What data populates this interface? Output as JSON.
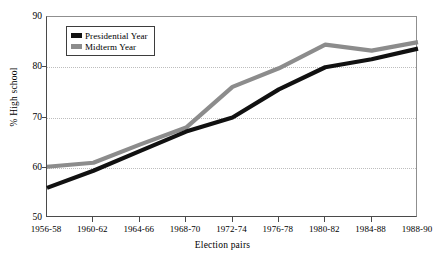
{
  "chart_data": {
    "type": "line",
    "title": "",
    "xlabel": "Election pairs",
    "ylabel": "% High school",
    "categories": [
      "1956-58",
      "1960-62",
      "1964-66",
      "1968-70",
      "1972-74",
      "1976-78",
      "1980-82",
      "1984-88",
      "1988-90"
    ],
    "ylim": [
      50,
      90
    ],
    "yticks": [
      50,
      60,
      70,
      80,
      90
    ],
    "gridlines": [
      60,
      70,
      80
    ],
    "grid": true,
    "legend_position": "upper-left-inside",
    "series": [
      {
        "name": "Presidential Year",
        "color": "#111111",
        "values": [
          56.0,
          59.4,
          63.3,
          67.2,
          70.0,
          75.6,
          80.0,
          81.6,
          83.7
        ]
      },
      {
        "name": "Midterm Year",
        "color": "#8c8c8c",
        "values": [
          60.2,
          61.0,
          64.6,
          68.0,
          76.1,
          79.8,
          84.5,
          83.3,
          85.0
        ]
      }
    ]
  },
  "legend": {
    "entries": [
      {
        "label": "Presidential Year",
        "swatch_color": "#111111"
      },
      {
        "label": "Midterm Year",
        "swatch_color": "#8c8c8c"
      }
    ]
  },
  "axes": {
    "y_title": "% High school",
    "x_title": "Election pairs",
    "y_tick_labels": [
      "90",
      "80",
      "70",
      "60",
      "50"
    ],
    "x_tick_labels": [
      "1956-58",
      "1960-62",
      "1964-66",
      "1968-70",
      "1972-74",
      "1976-78",
      "1980-82",
      "1984-88",
      "1988-90"
    ]
  },
  "colors": {
    "presidential": "#111111",
    "midterm": "#8c8c8c",
    "grid": "#bdbdbd",
    "axis": "#4a4a4a",
    "background": "#ffffff"
  }
}
